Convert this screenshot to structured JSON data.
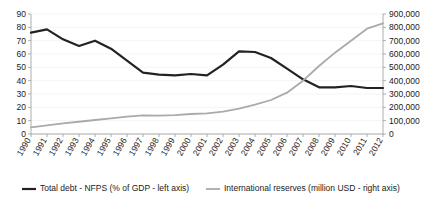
{
  "chart_data": {
    "type": "line",
    "title": "",
    "subtitle": "",
    "xlabel": "",
    "ylabel": "",
    "grid": true,
    "legend_position": "bottom",
    "categories": [
      "1990",
      "1991",
      "1992",
      "1993",
      "1994",
      "1995",
      "1996",
      "1997",
      "1998",
      "1999",
      "2000",
      "2001",
      "2002",
      "2003",
      "2004",
      "2005",
      "2006",
      "2007",
      "2008",
      "2009",
      "2010",
      "2011",
      "2012"
    ],
    "axes": {
      "left": {
        "label": "Total debt - NFPS (% of GDP)",
        "min": 0,
        "max": 90,
        "step": 10,
        "ticks": [
          "0",
          "10",
          "20",
          "30",
          "40",
          "50",
          "60",
          "70",
          "80",
          "90"
        ],
        "tick_values": [
          0,
          10,
          20,
          30,
          40,
          50,
          60,
          70,
          80,
          90
        ]
      },
      "right": {
        "label": "International reserves (million USD)",
        "min": 0,
        "max": 900000,
        "step": 100000,
        "ticks": [
          "0",
          "100,000",
          "200,000",
          "300,000",
          "400,000",
          "500,000",
          "600,000",
          "700,000",
          "800,000",
          "900,000"
        ],
        "tick_values": [
          0,
          100000,
          200000,
          300000,
          400000,
          500000,
          600000,
          700000,
          800000,
          900000
        ]
      }
    },
    "series": [
      {
        "name": "Total debt - NFPS (% of GDP - left axis)",
        "axis": "left",
        "color": "#222222",
        "width": 2.2,
        "values": [
          76,
          78.5,
          71,
          66,
          70,
          64,
          55,
          46,
          44.5,
          44,
          45,
          44,
          52,
          62,
          61.5,
          57,
          49,
          41,
          35,
          35,
          36,
          34.5,
          34.5
        ]
      },
      {
        "name": "International reserves (million USD - right axis)",
        "axis": "right",
        "color": "#aaaaaa",
        "width": 1.8,
        "values": [
          50000,
          65000,
          80000,
          92000,
          105000,
          118000,
          130000,
          140000,
          138000,
          142000,
          150000,
          155000,
          168000,
          190000,
          220000,
          255000,
          310000,
          400000,
          510000,
          610000,
          700000,
          790000,
          830000
        ]
      }
    ],
    "legend": [
      {
        "label": "Total debt - NFPS (% of GDP - left axis)",
        "color": "#222222"
      },
      {
        "label": "International reserves (million USD - right axis)",
        "color": "#aaaaaa"
      }
    ]
  }
}
